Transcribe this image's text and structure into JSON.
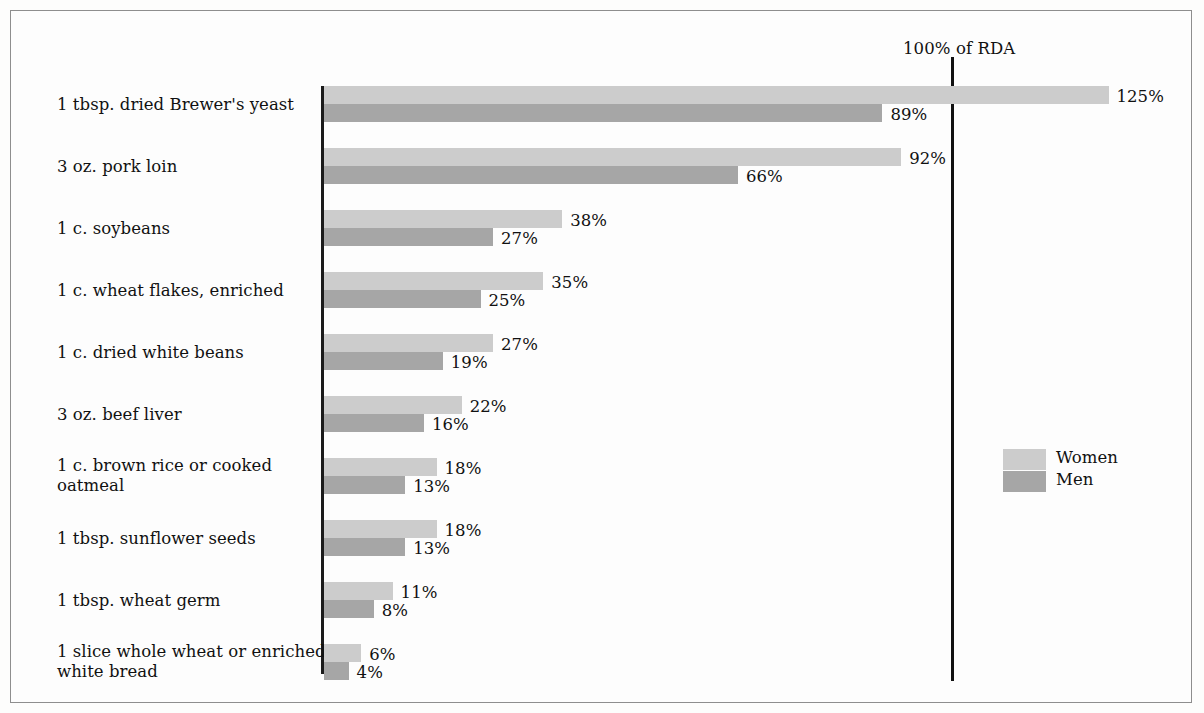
{
  "chart_data": {
    "type": "bar",
    "orientation": "horizontal",
    "title": "",
    "xlabel": "",
    "ylabel": "",
    "xlim": [
      0,
      133
    ],
    "grid": false,
    "legend_position": "right-middle",
    "reference_line": {
      "label": "100% of RDA",
      "value": 100
    },
    "categories": [
      "1 tbsp. dried Brewer's yeast",
      "3 oz. pork loin",
      "1 c. soybeans",
      "1 c. wheat flakes, enriched",
      "1 c. dried white beans",
      "3 oz. beef liver",
      "1 c. brown rice or cooked\noatmeal",
      "1 tbsp. sunflower seeds",
      "1 tbsp. wheat germ",
      "1 slice whole wheat or enriched\nwhite bread"
    ],
    "series": [
      {
        "name": "Women",
        "color": "#cccccc",
        "values": [
          125,
          92,
          38,
          35,
          27,
          22,
          18,
          18,
          11,
          6
        ],
        "value_labels": [
          "125%",
          "92%",
          "38%",
          "35%",
          "27%",
          "22%",
          "18%",
          "18%",
          "11%",
          "6%"
        ]
      },
      {
        "name": "Men",
        "color": "#a6a6a6",
        "values": [
          89,
          66,
          27,
          25,
          19,
          16,
          13,
          13,
          8,
          4
        ],
        "value_labels": [
          "89%",
          "66%",
          "27%",
          "25%",
          "19%",
          "16%",
          "13%",
          "13%",
          "8%",
          "4%"
        ]
      }
    ]
  },
  "legend": {
    "women_label": "Women",
    "men_label": "Men"
  },
  "rows": [
    {
      "label": "1 tbsp. dried Brewer's yeast",
      "women": 125,
      "men": 89,
      "women_label": "125%",
      "men_label": "89%"
    },
    {
      "label": "3 oz. pork loin",
      "women": 92,
      "men": 66,
      "women_label": "92%",
      "men_label": "66%"
    },
    {
      "label": "1 c. soybeans",
      "women": 38,
      "men": 27,
      "women_label": "38%",
      "men_label": "27%"
    },
    {
      "label": "1 c. wheat flakes, enriched",
      "women": 35,
      "men": 25,
      "women_label": "35%",
      "men_label": "25%"
    },
    {
      "label": "1 c. dried white beans",
      "women": 27,
      "men": 19,
      "women_label": "27%",
      "men_label": "19%"
    },
    {
      "label": "3 oz. beef liver",
      "women": 22,
      "men": 16,
      "women_label": "22%",
      "men_label": "16%"
    },
    {
      "label": "1 c. brown rice or cooked\noatmeal",
      "women": 18,
      "men": 13,
      "women_label": "18%",
      "men_label": "13%"
    },
    {
      "label": "1 tbsp. sunflower seeds",
      "women": 18,
      "men": 13,
      "women_label": "18%",
      "men_label": "13%"
    },
    {
      "label": "1 tbsp. wheat germ",
      "women": 11,
      "men": 8,
      "women_label": "11%",
      "men_label": "8%"
    },
    {
      "label": "1 slice whole wheat or enriched\nwhite bread",
      "women": 6,
      "men": 4,
      "women_label": "6%",
      "men_label": "4%"
    }
  ],
  "reference": {
    "label": "100% of RDA"
  }
}
